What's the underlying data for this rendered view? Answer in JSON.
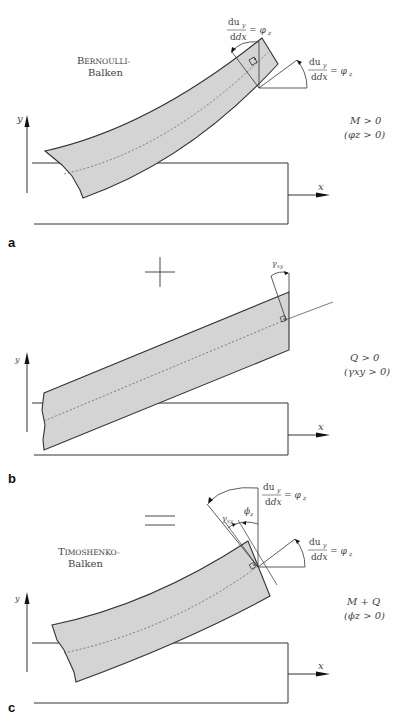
{
  "figure": {
    "panels": [
      {
        "letter": "a",
        "beam_label_line1_cap": "B",
        "beam_label_line1_rest": "ERNOULLI-",
        "beam_label_line2": "Balken",
        "condition_line1": "M > 0",
        "condition_line2": "(φz > 0)",
        "angle_label_top": {
          "num": "du",
          "num_sub": "y",
          "den": "dx",
          "rhs": "= φ",
          "rhs_sub": "z"
        },
        "angle_label_right": {
          "num": "du",
          "num_sub": "y",
          "den": "dx",
          "rhs": "= φ",
          "rhs_sub": "z"
        },
        "axis_x": "x",
        "axis_y": "y"
      },
      {
        "letter": "b",
        "operator": "+",
        "condition_line1": "Q > 0",
        "condition_line2": "(γxy > 0)",
        "shear_angle_label": "γ",
        "shear_angle_sub": "xy",
        "axis_x": "x",
        "axis_y": "y"
      },
      {
        "letter": "c",
        "operator": "=",
        "beam_label_line1_cap": "T",
        "beam_label_line1_rest": "IMOSHENKO-",
        "beam_label_line2": "Balken",
        "condition_line1": "M + Q",
        "condition_line2": "(ϕz > 0)",
        "angle_label_top": {
          "num": "du",
          "num_sub": "y",
          "den": "dx",
          "rhs": "= φ",
          "rhs_sub": "z"
        },
        "angle_label_right": {
          "num": "du",
          "num_sub": "y",
          "den": "dx",
          "rhs": "= φ",
          "rhs_sub": "z"
        },
        "gamma_label": "γ",
        "gamma_sub": "xy",
        "phi_label": "ϕ",
        "phi_sub": "z",
        "axis_x": "x",
        "axis_y": "y"
      }
    ],
    "colors": {
      "beam_fill": "#d4d4d4",
      "line": "#333333",
      "dashed_axis": "#555555"
    }
  }
}
